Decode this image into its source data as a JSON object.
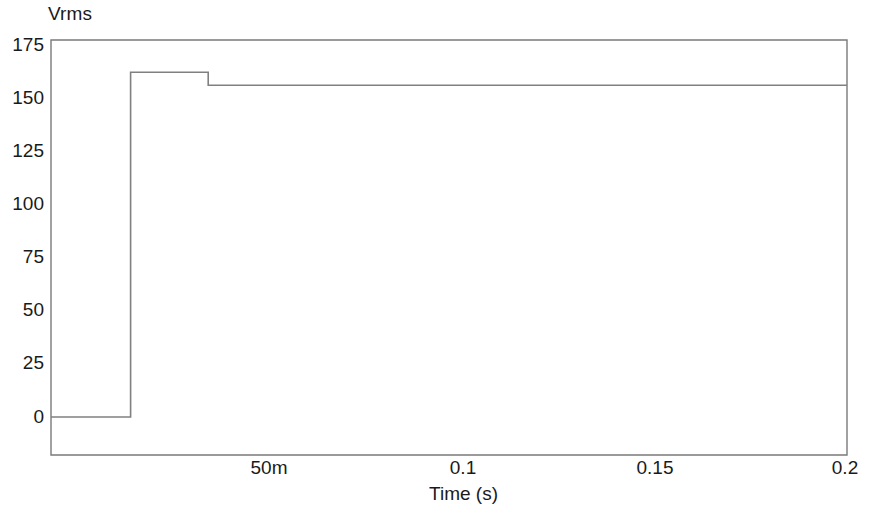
{
  "chart_data": {
    "type": "line",
    "title": "",
    "ylabel": "Vrms",
    "xlabel": "Time (s)",
    "xlim": [
      0,
      0.2
    ],
    "ylim": [
      0,
      175
    ],
    "grid": false,
    "legend": null,
    "y_ticks": [
      {
        "value": 175,
        "label": "175"
      },
      {
        "value": 150,
        "label": "150"
      },
      {
        "value": 125,
        "label": "125"
      },
      {
        "value": 100,
        "label": "100"
      },
      {
        "value": 75,
        "label": "75"
      },
      {
        "value": 50,
        "label": "50"
      },
      {
        "value": 25,
        "label": "25"
      },
      {
        "value": 0,
        "label": "0"
      }
    ],
    "x_ticks": [
      {
        "value": 0.05,
        "label": "50m"
      },
      {
        "value": 0.1,
        "label": "0.1"
      },
      {
        "value": 0.15,
        "label": "0.15"
      },
      {
        "value": 0.2,
        "label": "0.2"
      }
    ],
    "series": [
      {
        "name": "Vrms",
        "color": "#808080",
        "x": [
          0.0,
          0.02,
          0.02,
          0.0395,
          0.0395,
          0.2
        ],
        "values": [
          0,
          0,
          160,
          160,
          154,
          154
        ]
      }
    ],
    "annotations": {
      "initial_level": 0,
      "step_rise_time_s": 0.02,
      "peak_level": 160,
      "settle_time_s": 0.0395,
      "settled_level": 154,
      "final_level": 154
    }
  },
  "axis_frame_color": "#7a7a7a"
}
